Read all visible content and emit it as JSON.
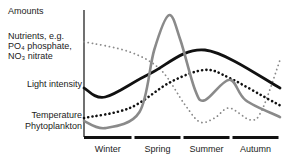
{
  "chart_data": {
    "type": "line",
    "title": "",
    "ylabel": "Amounts",
    "xlabel": "",
    "x_unit": "months from start of winter",
    "xlim": [
      0,
      12
    ],
    "ylim": [
      0,
      100
    ],
    "grid": false,
    "categories": [
      "Winter",
      "Spring",
      "Summer",
      "Autumn"
    ],
    "series": [
      {
        "name": "Nutrients, e.g. PO4 phosphate, NO3 nitrate",
        "label_lines": [
          "Nutrients, e.g.",
          "PO₄ phosphate,",
          "NO₃ nitrate"
        ],
        "style": "dotted",
        "color": "#8a8a8a",
        "x": [
          0,
          2.8,
          4.7,
          6.2,
          7.1,
          8.0,
          8.9,
          10.2,
          10.9,
          12
        ],
        "values": [
          75,
          67,
          52.8,
          25,
          11.8,
          15,
          22.8,
          13.4,
          21.3,
          60.6
        ]
      },
      {
        "name": "Light intensity",
        "label_lines": [
          "Light intensity"
        ],
        "style": "solid",
        "color": "#111111",
        "x": [
          0,
          1.3,
          4.0,
          7.4,
          12
        ],
        "values": [
          38.6,
          31.5,
          49.6,
          68.5,
          38.6
        ]
      },
      {
        "name": "Temperature",
        "label_lines": [
          "Temperature"
        ],
        "style": "dotted",
        "color": "#111111",
        "x": [
          0,
          2.8,
          5.3,
          7.4,
          8.9,
          11.4,
          12
        ],
        "values": [
          15,
          22.8,
          43.3,
          52.8,
          46.5,
          29,
          25
        ]
      },
      {
        "name": "Phytoplankton",
        "label_lines": [
          "Phytoplankton"
        ],
        "style": "solid",
        "color": "#8a8a8a",
        "x": [
          0,
          1.3,
          3.4,
          4.3,
          5.2,
          5.9,
          6.8,
          7.4,
          8.9,
          9.9,
          12
        ],
        "values": [
          12.6,
          7,
          19.7,
          68.5,
          96,
          76.4,
          37,
          29,
          45,
          29,
          15.7
        ]
      }
    ]
  }
}
